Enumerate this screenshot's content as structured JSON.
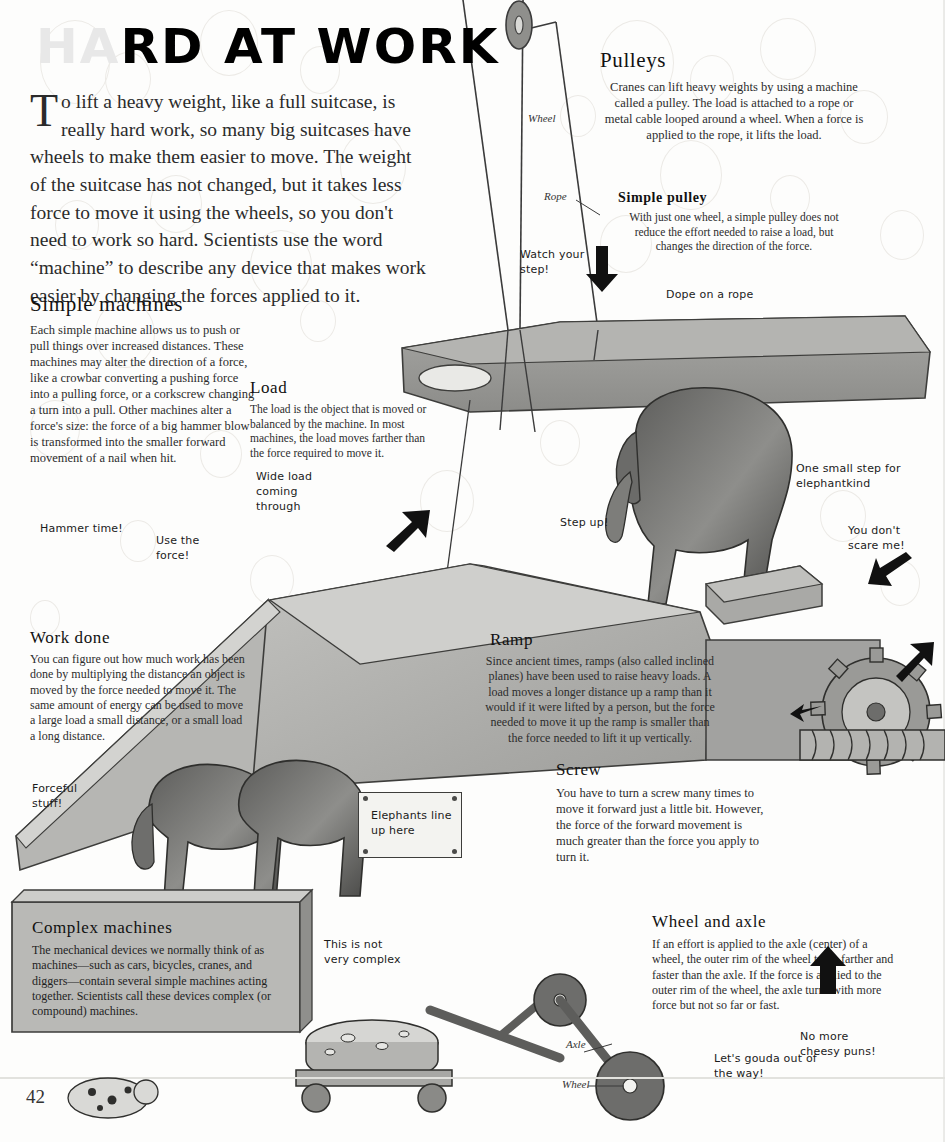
{
  "page": {
    "title_visible": "HARD AT WORK",
    "title_faded_prefix": "HA",
    "title_rest": "RD AT WORK",
    "page_number": "42",
    "intro_dropcap": "T",
    "intro_text": "o lift a heavy weight, like a full suitcase, is really hard work, so many big suitcases have wheels to make them easier to move. The weight of the suitcase has not changed, but it takes less force to move it using the wheels, so you don't need to work so hard. Scientists use the word “machine” to describe any device that makes work easier by changing the forces applied to it."
  },
  "sections": [
    {
      "id": "simple-machines",
      "heading": "Simple machines",
      "body": "Each simple machine allows us to push or pull things over increased distances. These machines may alter the direction of a force, like a crowbar converting a pushing force into a pulling force, or a corkscrew changing a turn into a pull. Other machines alter a force's size: the force of a big hammer blow is transformed into the smaller forward movement of a nail when hit."
    },
    {
      "id": "load",
      "heading": "Load",
      "body": "The load is the object that is moved or balanced by the machine. In most machines, the load moves farther than the force required to move it."
    },
    {
      "id": "pulleys",
      "heading": "Pulleys",
      "body": "Cranes can lift heavy weights by using a machine called a pulley. The load is attached to a rope or metal cable looped around a wheel. When a force is applied to the rope, it lifts the load."
    },
    {
      "id": "simple-pulley",
      "heading": "Simple pulley",
      "body": "With just one wheel, a simple pulley does not reduce the effort needed to raise a load, but changes the direction of the force."
    },
    {
      "id": "work-done",
      "heading": "Work done",
      "body": "You can figure out how much work has been done by multiplying the distance an object is moved by the force needed to move it. The same amount of energy can be used to move a large load a small distance, or a small load a long distance."
    },
    {
      "id": "ramp",
      "heading": "Ramp",
      "body": "Since ancient times, ramps (also called inclined planes) have been used to raise heavy loads. A load moves a longer distance up a ramp than it would if it were lifted by a person, but the force needed to move it up the ramp is smaller than the force needed to lift it up vertically."
    },
    {
      "id": "screw",
      "heading": "Screw",
      "body": "You have to turn a screw many times to move it forward just a little bit. However, the force of the forward movement is much greater than the force you apply to turn it."
    },
    {
      "id": "complex-machines",
      "heading": "Complex machines",
      "body": "The mechanical devices we normally think of as machines—such as cars, bicycles, cranes, and diggers—contain several simple machines acting together. Scientists call these devices complex (or compound) machines."
    },
    {
      "id": "wheel-and-axle",
      "heading": "Wheel and axle",
      "body": "If an effort is applied to the axle (center) of a wheel, the outer rim of the wheel turns farther and faster than the axle. If the force is applied to the outer rim of the wheel, the axle turns with more force but not so far or fast."
    }
  ],
  "diagram_labels": [
    {
      "id": "wheel-top",
      "text": "Wheel"
    },
    {
      "id": "rope",
      "text": "Rope"
    },
    {
      "id": "axle-bottom",
      "text": "Axle"
    },
    {
      "id": "wheel-bottom",
      "text": "Wheel"
    }
  ],
  "captions": [
    {
      "id": "watch-your-step",
      "text": "Watch your step!"
    },
    {
      "id": "dope-on-a-rope",
      "text": "Dope on a rope"
    },
    {
      "id": "wide-load",
      "text": "Wide load coming through"
    },
    {
      "id": "hammer-time",
      "text": "Hammer time!"
    },
    {
      "id": "use-the-force",
      "text": "Use the force!"
    },
    {
      "id": "step-up",
      "text": "Step up!"
    },
    {
      "id": "one-small-step",
      "text": "One small step for elephantkind"
    },
    {
      "id": "you-dont-scare-me",
      "text": "You don't scare me!"
    },
    {
      "id": "forceful-stuff",
      "text": "Forceful stuff!"
    },
    {
      "id": "elephants-line-up",
      "text": "Elephants line up here"
    },
    {
      "id": "this-is-not-very-complex",
      "text": "This is not very complex"
    },
    {
      "id": "lets-gouda-out",
      "text": "Let's gouda out of the way!"
    },
    {
      "id": "no-more-cheesy-puns",
      "text": "No more cheesy puns!"
    }
  ],
  "palette": {
    "paper": "#fdfdfc",
    "platform_grey": "#9b9b98",
    "panel_grey": "#b9b9b6",
    "dark_grey": "#6f6f6d",
    "ink": "#1b1b1b",
    "bubble_outline": "#eceae6"
  }
}
